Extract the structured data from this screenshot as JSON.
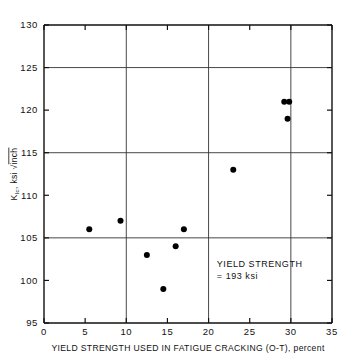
{
  "chart_data": {
    "type": "scatter",
    "title": "",
    "xlabel": "YIELD STRENGTH USED IN FATIGUE CRACKING (O-T), percent",
    "ylabel": "K_Ic, ksi √inch",
    "ylabel_main": "K",
    "ylabel_sub": "Ic",
    "ylabel_rest": ", ksi",
    "ylabel_sqrt_arg": "inch",
    "xlim": [
      0,
      35
    ],
    "ylim": [
      95,
      130
    ],
    "xticks": [
      0,
      5,
      10,
      15,
      20,
      25,
      30,
      35
    ],
    "yticks": [
      95,
      100,
      105,
      110,
      115,
      120,
      125,
      130
    ],
    "xtick_labels": [
      "0",
      "5",
      "10",
      "15",
      "20",
      "25",
      "30",
      "35"
    ],
    "ytick_labels": [
      "95",
      "100",
      "105",
      "110",
      "115",
      "120",
      "125",
      "130"
    ],
    "grid": true,
    "grid_x": [
      10,
      20,
      30
    ],
    "grid_y": [
      105,
      115,
      125
    ],
    "legend": "",
    "marker": "filled-circle",
    "marker_color": "#000000",
    "points": [
      {
        "x": 5.5,
        "y": 106
      },
      {
        "x": 9.3,
        "y": 107
      },
      {
        "x": 12.5,
        "y": 103
      },
      {
        "x": 14.5,
        "y": 99
      },
      {
        "x": 16.0,
        "y": 104
      },
      {
        "x": 17.0,
        "y": 106
      },
      {
        "x": 23.0,
        "y": 113
      },
      {
        "x": 29.2,
        "y": 121
      },
      {
        "x": 29.8,
        "y": 121
      },
      {
        "x": 29.6,
        "y": 119
      }
    ],
    "annotations": [
      {
        "name": "yield-strength-note",
        "line1": "YIELD STRENGTH",
        "line2": "= 193 ksi",
        "x": 21.0,
        "y": 101.6
      }
    ]
  }
}
